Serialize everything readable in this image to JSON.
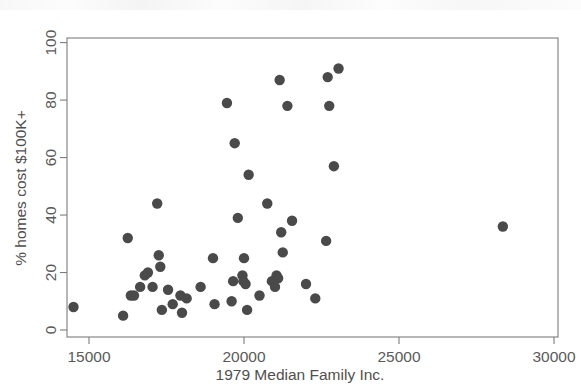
{
  "figure": {
    "background_color": "#ffffff",
    "marker_color": "#4a4a4a",
    "axis_color": "#7d7d7d",
    "text_color": "#4f4f4f"
  },
  "chart_data": {
    "type": "scatter",
    "title": "",
    "xlabel": "1979 Median Family Inc.",
    "ylabel": "% homes cost $100K+",
    "xlim": [
      14000,
      30000
    ],
    "ylim": [
      -2,
      103
    ],
    "xticks": [
      15000,
      20000,
      25000,
      30000
    ],
    "xtick_labels": [
      "15000",
      "20000",
      "25000",
      "30000"
    ],
    "yticks": [
      0,
      20,
      40,
      60,
      80,
      100
    ],
    "ytick_labels": [
      "0",
      "20",
      "40",
      "60",
      "80",
      "100"
    ],
    "grid": false,
    "legend": null,
    "marker_size": 8,
    "points": [
      {
        "x": 14500,
        "y": 8
      },
      {
        "x": 16100,
        "y": 5
      },
      {
        "x": 16250,
        "y": 32
      },
      {
        "x": 16350,
        "y": 12
      },
      {
        "x": 16450,
        "y": 12
      },
      {
        "x": 16650,
        "y": 15
      },
      {
        "x": 16800,
        "y": 19
      },
      {
        "x": 16900,
        "y": 20
      },
      {
        "x": 17050,
        "y": 15
      },
      {
        "x": 17200,
        "y": 44
      },
      {
        "x": 17250,
        "y": 26
      },
      {
        "x": 17300,
        "y": 22
      },
      {
        "x": 17350,
        "y": 7
      },
      {
        "x": 17550,
        "y": 14
      },
      {
        "x": 17700,
        "y": 9
      },
      {
        "x": 17950,
        "y": 12
      },
      {
        "x": 18000,
        "y": 6
      },
      {
        "x": 18150,
        "y": 11
      },
      {
        "x": 18600,
        "y": 15
      },
      {
        "x": 19000,
        "y": 25
      },
      {
        "x": 19050,
        "y": 9
      },
      {
        "x": 19450,
        "y": 79
      },
      {
        "x": 19600,
        "y": 10
      },
      {
        "x": 19650,
        "y": 17
      },
      {
        "x": 19700,
        "y": 65
      },
      {
        "x": 19800,
        "y": 39
      },
      {
        "x": 19950,
        "y": 19
      },
      {
        "x": 19980,
        "y": 17
      },
      {
        "x": 20000,
        "y": 25
      },
      {
        "x": 20050,
        "y": 16
      },
      {
        "x": 20100,
        "y": 7
      },
      {
        "x": 20150,
        "y": 54
      },
      {
        "x": 20500,
        "y": 12
      },
      {
        "x": 20750,
        "y": 44
      },
      {
        "x": 20900,
        "y": 17
      },
      {
        "x": 21000,
        "y": 15
      },
      {
        "x": 21050,
        "y": 19
      },
      {
        "x": 21100,
        "y": 18
      },
      {
        "x": 21150,
        "y": 87
      },
      {
        "x": 21200,
        "y": 34
      },
      {
        "x": 21250,
        "y": 27
      },
      {
        "x": 21400,
        "y": 78
      },
      {
        "x": 21550,
        "y": 38
      },
      {
        "x": 22000,
        "y": 16
      },
      {
        "x": 22300,
        "y": 11
      },
      {
        "x": 22650,
        "y": 31
      },
      {
        "x": 22700,
        "y": 88
      },
      {
        "x": 22750,
        "y": 78
      },
      {
        "x": 22900,
        "y": 57
      },
      {
        "x": 23050,
        "y": 91
      },
      {
        "x": 28350,
        "y": 36
      }
    ]
  }
}
